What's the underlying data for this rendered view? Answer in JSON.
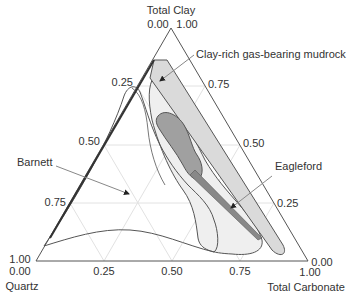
{
  "diagram": {
    "type": "ternary",
    "vertices": {
      "top": {
        "name": "Total Clay",
        "labels": [
          "0.00",
          "1.00"
        ]
      },
      "bottom_left": {
        "name": "Quartz",
        "labels": [
          "1.00",
          "0.00"
        ]
      },
      "bottom_right": {
        "name": "Total Carbonate",
        "labels": [
          "0.00",
          "1.00"
        ]
      }
    },
    "ticks": {
      "left_edge": [
        "0.25",
        "0.50",
        "0.75"
      ],
      "right_edge": [
        "0.75",
        "0.50",
        "0.25"
      ],
      "bottom_edge": [
        "0.25",
        "0.50",
        "0.75"
      ]
    },
    "annotations": {
      "clay_rich": "Clay-rich gas-bearing mudrock",
      "barnett": "Barnett",
      "eagleford": "Eagleford"
    },
    "colors": {
      "axis": "#555555",
      "grid": "#dddddd",
      "clay_fill": "#dcdcdc",
      "clay_core_fill": "#9a9a9a",
      "eagleford_fill": "#eeeeee",
      "outline": "#555555"
    }
  }
}
